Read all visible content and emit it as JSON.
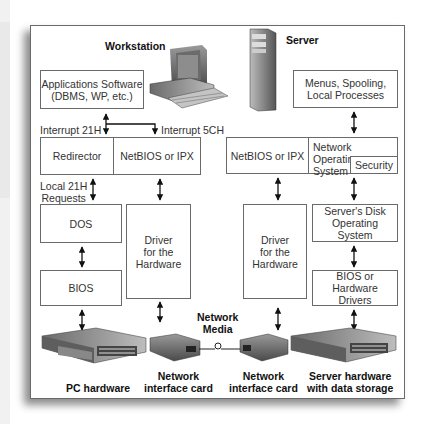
{
  "titles": {
    "workstation": "Workstation",
    "server": "Server"
  },
  "workstation": {
    "applications": "Applications Software\n(DBMS, WP, etc.)",
    "interrupt_21h": "Interrupt 21H",
    "interrupt_5ch": "Interrupt 5CH",
    "redirector": "Redirector",
    "netbios": "NetBIOS or IPX",
    "local_requests": "Local 21H\nRequests",
    "dos": "DOS",
    "bios": "BIOS",
    "driver": "Driver\nfor the\nHardware",
    "pc_hardware": "PC hardware",
    "nic": "Network\ninterface card"
  },
  "server": {
    "menus": "Menus, Spooling,\nLocal Processes",
    "netbios": "NetBIOS or IPX",
    "nos": "Network Operating\nSystem",
    "security": "Security",
    "driver": "Driver\nfor the\nHardware",
    "disk_os": "Server's Disk\nOperating System",
    "bios_drivers": "BIOS or Hardware\nDrivers",
    "nic": "Network\ninterface card",
    "hardware": "Server hardware\nwith data storage"
  },
  "network_media": "Network\nMedia"
}
